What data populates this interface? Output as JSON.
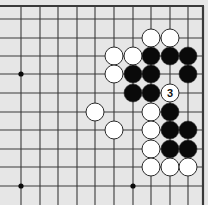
{
  "diagram": {
    "type": "go-board-corner",
    "colors": {
      "background": "#e6e6e6",
      "line": "#3a3a3a",
      "edge": "#3a3a3a",
      "black_stone": "#0a0a0a",
      "white_stone": "#ffffff",
      "stone_outline": "#2a2a2a",
      "hoshi": "#0a0a0a"
    },
    "grid": {
      "columns_x": [
        21,
        40,
        58,
        77,
        95,
        114,
        133,
        151,
        170,
        188
      ],
      "rows_y": [
        19,
        38,
        56,
        74,
        93,
        112,
        130,
        149,
        167,
        186
      ],
      "top_edge_y": 6,
      "right_edge_x": 203,
      "stone_radius": 9
    },
    "hoshi": [
      {
        "col": 0,
        "row": 3
      },
      {
        "col": 0,
        "row": 9
      },
      {
        "col": 6,
        "row": 9
      }
    ],
    "stones": [
      {
        "color": "white",
        "col": 7,
        "row": 1
      },
      {
        "color": "white",
        "col": 8,
        "row": 1
      },
      {
        "color": "white",
        "col": 5,
        "row": 2
      },
      {
        "color": "white",
        "col": 6,
        "row": 2
      },
      {
        "color": "black",
        "col": 7,
        "row": 2
      },
      {
        "color": "black",
        "col": 8,
        "row": 2
      },
      {
        "color": "black",
        "col": 9,
        "row": 2
      },
      {
        "color": "white",
        "col": 5,
        "row": 3
      },
      {
        "color": "black",
        "col": 6,
        "row": 3
      },
      {
        "color": "black",
        "col": 7,
        "row": 3
      },
      {
        "color": "black",
        "col": 9,
        "row": 3
      },
      {
        "color": "black",
        "col": 6,
        "row": 4
      },
      {
        "color": "black",
        "col": 7,
        "row": 4
      },
      {
        "color": "white",
        "col": 8,
        "row": 4,
        "label": "3"
      },
      {
        "color": "white",
        "col": 4,
        "row": 5
      },
      {
        "color": "white",
        "col": 7,
        "row": 5
      },
      {
        "color": "black",
        "col": 8,
        "row": 5
      },
      {
        "color": "white",
        "col": 5,
        "row": 6
      },
      {
        "color": "white",
        "col": 7,
        "row": 6
      },
      {
        "color": "black",
        "col": 8,
        "row": 6
      },
      {
        "color": "black",
        "col": 9,
        "row": 6
      },
      {
        "color": "white",
        "col": 7,
        "row": 7
      },
      {
        "color": "black",
        "col": 8,
        "row": 7
      },
      {
        "color": "black",
        "col": 9,
        "row": 7
      },
      {
        "color": "white",
        "col": 7,
        "row": 8
      },
      {
        "color": "white",
        "col": 8,
        "row": 8
      },
      {
        "color": "white",
        "col": 9,
        "row": 8
      }
    ]
  }
}
